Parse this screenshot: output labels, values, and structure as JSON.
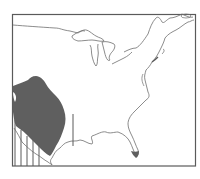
{
  "map": {
    "type": "species-range-map",
    "region": "eastern-north-america",
    "colors": {
      "background": "#ffffff",
      "frame": "#5a5a5a",
      "outline": "#6e6e6e",
      "range_fill": "#5f5f5f"
    },
    "frame": {
      "x": 12,
      "y": 14,
      "width": 183,
      "height": 152
    },
    "layers": [
      {
        "name": "coastline-and-borders",
        "kind": "outline"
      },
      {
        "name": "great-lakes",
        "kind": "outline"
      },
      {
        "name": "range-primary",
        "kind": "filled-area",
        "label": ""
      },
      {
        "name": "range-florida-tip",
        "kind": "filled-area",
        "label": ""
      },
      {
        "name": "range-hatching",
        "kind": "vertical-lines",
        "label": ""
      }
    ]
  }
}
